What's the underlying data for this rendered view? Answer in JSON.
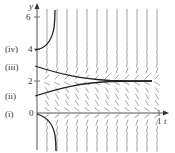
{
  "figure": {
    "type": "slope_field",
    "axes": {
      "x_label": "t",
      "y_label": "y",
      "y_ticks": [
        "0",
        "2",
        "4",
        "6"
      ],
      "x_ticks": [
        "1"
      ]
    },
    "curve_labels": [
      "(i)",
      "(ii)",
      "(iii)",
      "(iv)"
    ],
    "colors": {
      "axis": "#555555",
      "curve": "#222222",
      "slope": "#8a8a8a"
    }
  },
  "chart_data": {
    "type": "line",
    "title": "",
    "xlabel": "t",
    "ylabel": "y",
    "xlim": [
      0,
      1.05
    ],
    "ylim": [
      -2.4,
      6.6
    ],
    "equilibria": [
      0,
      2
    ],
    "series": [
      {
        "name": "(i)",
        "initial_y": 0,
        "behavior": "decreasing below 0, diverging to -infinity"
      },
      {
        "name": "(ii)",
        "initial_y": 1.2,
        "behavior": "increasing toward 2"
      },
      {
        "name": "(iii)",
        "initial_y": 3.2,
        "behavior": "decreasing toward 2"
      },
      {
        "name": "(iv)",
        "initial_y": 4,
        "behavior": "increasing, diverging to +infinity"
      }
    ]
  }
}
